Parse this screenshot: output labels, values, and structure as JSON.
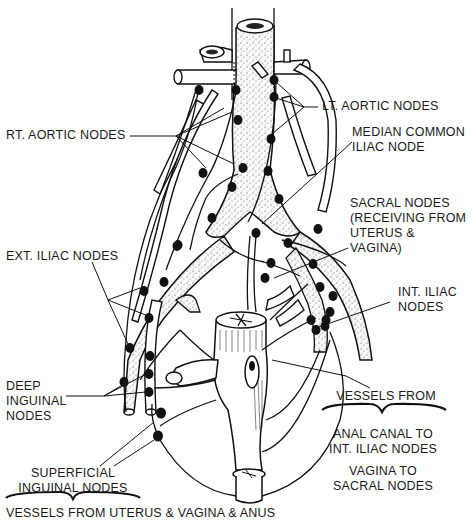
{
  "figure": {
    "labels": {
      "rt_aortic": "RT. AORTIC NODES",
      "lt_aortic": "LT. AORTIC NODES",
      "median_common_iliac": [
        "MEDIAN COMMON",
        "ILIAC NODE"
      ],
      "sacral": [
        "SACRAL NODES",
        "(RECEIVING FROM",
        "UTERUS &",
        "VAGINA)"
      ],
      "ext_iliac": "EXT. ILIAC NODES",
      "int_iliac": [
        "INT. ILIAC",
        "NODES"
      ],
      "deep_inguinal": [
        "DEEP",
        "INGUINAL",
        "NODES"
      ],
      "vessels_from": "VESSELS FROM",
      "anal_canal": [
        "ANAL CANAL TO",
        "INT. ILIAC NODES"
      ],
      "vagina_to_sacral": [
        "VAGINA TO",
        "SACRAL NODES"
      ],
      "superficial_inguinal": [
        "SUPERFICIAL",
        "INGUINAL NODES"
      ],
      "caption": "VESSELS FROM UTERUS & VAGINA & ANUS"
    },
    "icons": {
      "aorta": "aorta-vessel",
      "node": "lymph-node-dot",
      "organ": "uterus-vagina-anal-canal"
    }
  }
}
